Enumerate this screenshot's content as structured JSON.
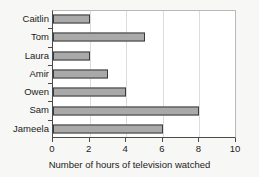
{
  "chart_data": {
    "type": "bar",
    "orientation": "horizontal",
    "title": "",
    "xlabel": "Number of hours of television watched",
    "ylabel": "",
    "categories": [
      "Caitlin",
      "Tom",
      "Laura",
      "Amir",
      "Owen",
      "Sam",
      "Jameela"
    ],
    "values": [
      2,
      5,
      2,
      3,
      4,
      8,
      6
    ],
    "xlim": [
      0,
      10
    ],
    "xticks": [
      0,
      2,
      4,
      6,
      8,
      10
    ],
    "xtick_labels": [
      "0",
      "2",
      "4",
      "6",
      "8",
      "10"
    ],
    "grid": "vertical",
    "legend": null,
    "colors": {
      "bar_fill": "#a9a9a9",
      "bar_edge": "#3a3a3a",
      "plot_background": "#ffffff",
      "page_background": "#f7f7f5",
      "gridline": "#dcdcdc",
      "axis": "#4a4a4a",
      "text": "#1b1b1b"
    }
  }
}
